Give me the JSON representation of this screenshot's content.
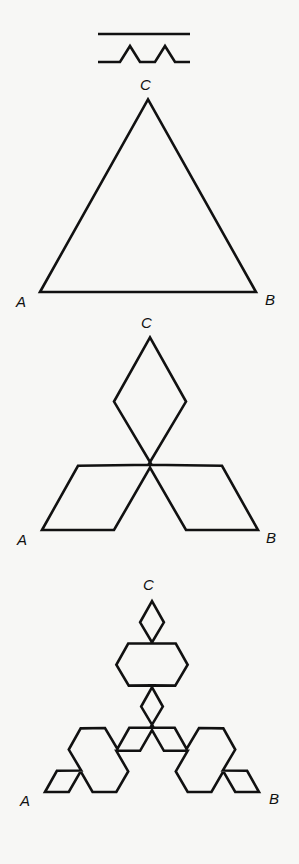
{
  "rule": {
    "description": "Generator: a straight segment is replaced by four segments with an equilateral bump",
    "initiator_label": "segment",
    "generator_label": "generator"
  },
  "figures": [
    {
      "name": "iteration-0",
      "iteration": 0,
      "labels": {
        "a": "A",
        "b": "B",
        "c": "C"
      }
    },
    {
      "name": "iteration-1",
      "iteration": 1,
      "labels": {
        "a": "A",
        "b": "B",
        "c": "C"
      }
    },
    {
      "name": "iteration-2",
      "iteration": 2,
      "labels": {
        "a": "A",
        "b": "B",
        "c": "C"
      }
    }
  ],
  "colors": {
    "stroke": "#111111",
    "background": "#f7f7f5"
  }
}
